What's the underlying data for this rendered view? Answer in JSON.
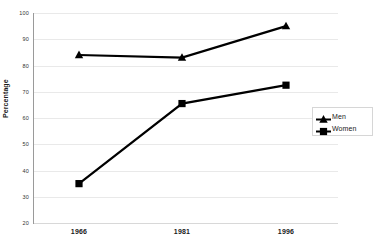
{
  "chart_data": {
    "type": "line",
    "title": "",
    "xlabel": "",
    "ylabel": "Percentage",
    "categories": [
      "1966",
      "1981",
      "1996"
    ],
    "series": [
      {
        "name": "Men",
        "marker": "triangle",
        "color": "#000000",
        "values": [
          84,
          83,
          95
        ]
      },
      {
        "name": "Women",
        "marker": "square",
        "color": "#000000",
        "values": [
          35,
          65.5,
          72.5
        ]
      }
    ],
    "ylim": [
      20,
      100
    ],
    "ytick_step": 10,
    "ytick_labels": [
      "100",
      "90",
      "80",
      "70",
      "60",
      "50",
      "40",
      "30",
      "20"
    ],
    "grid": true,
    "grid_color": "#e9e9e9",
    "legend_position": "right-middle",
    "axis_color": "#9a9a9a",
    "background": "#ffffff"
  }
}
